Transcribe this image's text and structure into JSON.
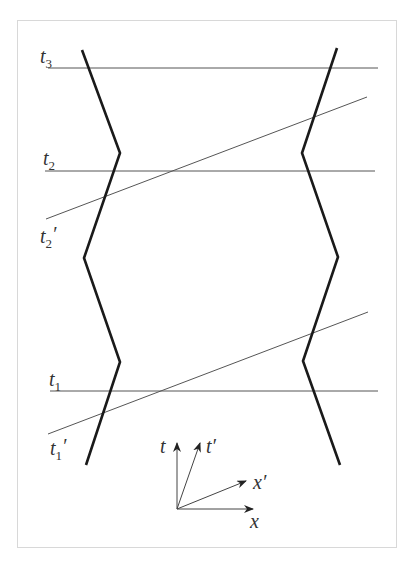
{
  "diagram": {
    "type": "spacetime-diagram",
    "frame": {
      "x": 17,
      "y": 20,
      "width": 380,
      "height": 528,
      "stroke": "#d8d8d8"
    },
    "colors": {
      "worldline": "#1a1a1a",
      "simultaneity": "#555555",
      "label": "#333333",
      "axis": "#444444"
    },
    "worldlines": [
      {
        "name": "left-worldline",
        "points": [
          [
            82,
            50
          ],
          [
            120,
            153
          ],
          [
            84,
            258
          ],
          [
            120,
            362
          ],
          [
            86,
            465
          ]
        ]
      },
      {
        "name": "right-worldline",
        "points": [
          [
            337,
            48
          ],
          [
            302,
            153
          ],
          [
            338,
            257
          ],
          [
            303,
            361
          ],
          [
            340,
            465
          ]
        ]
      }
    ],
    "simultaneity_lines": [
      {
        "name": "t3-line",
        "label": "t",
        "sub": "3",
        "prime": "",
        "x1": 48,
        "y1": 68,
        "x2": 378,
        "y2": 68,
        "label_x": 40,
        "label_y": 63
      },
      {
        "name": "t2-line",
        "label": "t",
        "sub": "2",
        "prime": "",
        "x1": 45,
        "y1": 171,
        "x2": 375,
        "y2": 171,
        "label_x": 43,
        "label_y": 165
      },
      {
        "name": "t2-prime-line",
        "label": "t",
        "sub": "2",
        "prime": "′",
        "x1": 46,
        "y1": 219,
        "x2": 367,
        "y2": 97,
        "label_x": 40,
        "label_y": 243
      },
      {
        "name": "t1-line",
        "label": "t",
        "sub": "1",
        "prime": "",
        "x1": 50,
        "y1": 391,
        "x2": 378,
        "y2": 391,
        "label_x": 49,
        "label_y": 386
      },
      {
        "name": "t1-prime-line",
        "label": "t",
        "sub": "1",
        "prime": "′",
        "x1": 48,
        "y1": 434,
        "x2": 368,
        "y2": 312,
        "label_x": 50,
        "label_y": 455
      }
    ],
    "axes": {
      "origin": [
        177,
        509
      ],
      "vectors": [
        {
          "name": "t-axis",
          "label": "t",
          "to": [
            177,
            443
          ],
          "label_x": 160,
          "label_y": 453
        },
        {
          "name": "t-prime-axis",
          "label": "t′",
          "to": [
            200,
            443
          ],
          "label_x": 206,
          "label_y": 453
        },
        {
          "name": "x-prime-axis",
          "label": "x′",
          "to": [
            246,
            481
          ],
          "label_x": 253,
          "label_y": 489
        },
        {
          "name": "x-axis",
          "label": "x",
          "to": [
            253,
            509
          ],
          "label_x": 250,
          "label_y": 528
        }
      ]
    }
  },
  "labels": {
    "t3": {
      "main": "t",
      "sub": "3"
    },
    "t2": {
      "main": "t",
      "sub": "2"
    },
    "t2p": {
      "main": "t",
      "sub": "2",
      "prime": "′"
    },
    "t1": {
      "main": "t",
      "sub": "1"
    },
    "t1p": {
      "main": "t",
      "sub": "1",
      "prime": "′"
    },
    "axis_t": "t",
    "axis_tp": "t′",
    "axis_xp": "x′",
    "axis_x": "x"
  }
}
